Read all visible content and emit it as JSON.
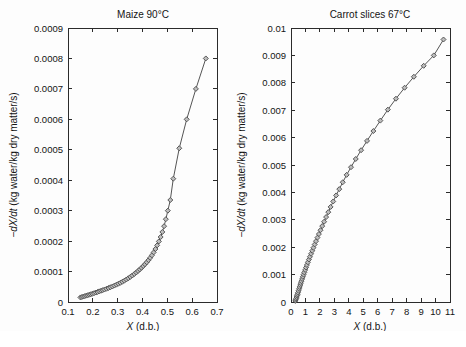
{
  "figure": {
    "background": "#fdfdfd",
    "marker_fill": "#bdbdbd",
    "marker_stroke": "#4a4a4a",
    "line_color": "#555555",
    "axis_color": "#2b2b2b"
  },
  "panels": [
    {
      "id": "maize",
      "title": "Maize  90°C",
      "xlabel_italic": "X",
      "xlabel_rest": " (d.b.)",
      "ylabel_italic": "−dX/dt",
      "ylabel_rest": " (kg water/kg dry matter/s)",
      "xticks": [
        "0.1",
        "0.2",
        "0.3",
        "0.4",
        "0.5",
        "0.6",
        "0.7"
      ],
      "xtickvals": [
        0.1,
        0.2,
        0.3,
        0.4,
        0.5,
        0.6,
        0.7
      ],
      "yticks": [
        "0",
        "0.0001",
        "0.0002",
        "0.0003",
        "0.0004",
        "0.0005",
        "0.0006",
        "0.0007",
        "0.0008",
        "0.0009"
      ],
      "ytickvals": [
        0,
        0.0001,
        0.0002,
        0.0003,
        0.0004,
        0.0005,
        0.0006,
        0.0007,
        0.0008,
        0.0009
      ],
      "xlim": [
        0.1,
        0.7
      ],
      "ylim": [
        0,
        0.0009
      ]
    },
    {
      "id": "carrot",
      "title": "Carrot slices  67°C",
      "xlabel_italic": "X",
      "xlabel_rest": " (d.b.)",
      "ylabel_italic": "−dX/dt",
      "ylabel_rest": " (kg water/kg dry matter/s)",
      "xticks": [
        "0",
        "1",
        "2",
        "3",
        "4",
        "5",
        "6",
        "7",
        "8",
        "9",
        "10",
        "11"
      ],
      "xtickvals": [
        0,
        1,
        2,
        3,
        4,
        5,
        6,
        7,
        8,
        9,
        10,
        11
      ],
      "yticks": [
        "0",
        "0.001",
        "0.002",
        "0.003",
        "0.004",
        "0.005",
        "0.006",
        "0.007",
        "0.008",
        "0.009",
        "0.01"
      ],
      "ytickvals": [
        0,
        0.001,
        0.002,
        0.003,
        0.004,
        0.005,
        0.006,
        0.007,
        0.008,
        0.009,
        0.01
      ],
      "xlim": [
        0,
        11
      ],
      "ylim": [
        0,
        0.01
      ]
    }
  ],
  "chart_data": [
    {
      "type": "scatter",
      "title": "Maize  90°C",
      "xlabel": "X (d.b.)",
      "ylabel": "-dX/dt (kg water/kg dry matter/s)",
      "xlim": [
        0.1,
        0.7
      ],
      "ylim": [
        0,
        0.0009
      ],
      "grid": false,
      "legend": "none",
      "marker": "diamond",
      "series": [
        {
          "name": "Maize 90C drying rate",
          "x": [
            0.15,
            0.156,
            0.162,
            0.168,
            0.174,
            0.18,
            0.186,
            0.192,
            0.198,
            0.205,
            0.212,
            0.219,
            0.226,
            0.233,
            0.24,
            0.247,
            0.255,
            0.263,
            0.271,
            0.279,
            0.287,
            0.295,
            0.303,
            0.311,
            0.319,
            0.327,
            0.335,
            0.343,
            0.351,
            0.359,
            0.367,
            0.375,
            0.382,
            0.389,
            0.396,
            0.403,
            0.41,
            0.417,
            0.424,
            0.431,
            0.438,
            0.445,
            0.452,
            0.459,
            0.466,
            0.473,
            0.48,
            0.487,
            0.494,
            0.502,
            0.512,
            0.524,
            0.548,
            0.578,
            0.615,
            0.655
          ],
          "y": [
            1.5e-05,
            1.65e-05,
            1.8e-05,
            1.95e-05,
            2.1e-05,
            2.25e-05,
            2.4e-05,
            2.55e-05,
            2.7e-05,
            2.9e-05,
            3.1e-05,
            3.3e-05,
            3.5e-05,
            3.7e-05,
            3.9e-05,
            4.1e-05,
            4.35e-05,
            4.6e-05,
            4.85e-05,
            5.1e-05,
            5.4e-05,
            5.7e-05,
            6e-05,
            6.3e-05,
            6.65e-05,
            7e-05,
            7.4e-05,
            7.8e-05,
            8.25e-05,
            8.7e-05,
            9.2e-05,
            9.7e-05,
            0.000102,
            0.000107,
            0.0001125,
            0.000118,
            0.000124,
            0.0001305,
            0.0001375,
            0.000145,
            0.0001535,
            0.000163,
            0.000174,
            0.000186,
            0.000199,
            0.0002135,
            0.00023,
            0.000249,
            0.000272,
            0.0003,
            0.000335,
            0.000405,
            0.000505,
            0.0006,
            0.0007,
            0.0008
          ]
        }
      ]
    },
    {
      "type": "scatter",
      "title": "Carrot slices  67°C",
      "xlabel": "X (d.b.)",
      "ylabel": "-dX/dt (kg water/kg dry matter/s)",
      "xlim": [
        0,
        11
      ],
      "ylim": [
        0,
        0.01
      ],
      "grid": false,
      "legend": "none",
      "marker": "diamond",
      "series": [
        {
          "name": "Carrot slices 67C drying rate",
          "x": [
            0.3,
            0.33,
            0.36,
            0.39,
            0.42,
            0.45,
            0.48,
            0.52,
            0.56,
            0.6,
            0.64,
            0.68,
            0.72,
            0.77,
            0.82,
            0.87,
            0.92,
            0.98,
            1.04,
            1.1,
            1.17,
            1.24,
            1.31,
            1.39,
            1.47,
            1.55,
            1.64,
            1.73,
            1.83,
            1.93,
            2.04,
            2.16,
            2.29,
            2.43,
            2.58,
            2.74,
            2.92,
            3.12,
            3.34,
            3.58,
            3.85,
            4.15,
            4.48,
            4.85,
            5.26,
            5.7,
            6.18,
            6.7,
            7.26,
            7.86,
            8.5,
            9.18,
            9.88,
            10.55
          ],
          "y": [
            4e-05,
            8e-05,
            0.00013,
            0.00018,
            0.00023,
            0.00028,
            0.00034,
            0.00041,
            0.00048,
            0.00055,
            0.00062,
            0.00069,
            0.00076,
            0.00084,
            0.00092,
            0.001,
            0.00108,
            0.00117,
            0.00126,
            0.00135,
            0.00145,
            0.00155,
            0.00165,
            0.00176,
            0.00187,
            0.00198,
            0.0021,
            0.00222,
            0.00235,
            0.00248,
            0.00262,
            0.00277,
            0.00293,
            0.0031,
            0.00328,
            0.00347,
            0.00367,
            0.00389,
            0.00412,
            0.00437,
            0.00464,
            0.00492,
            0.00522,
            0.00554,
            0.00588,
            0.00624,
            0.00662,
            0.00702,
            0.00742,
            0.00782,
            0.00822,
            0.00862,
            0.009,
            0.00958
          ]
        }
      ]
    }
  ]
}
